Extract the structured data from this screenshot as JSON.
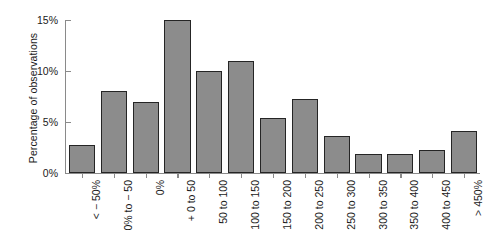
{
  "chart_data": {
    "type": "bar",
    "title": "",
    "subtitle": "",
    "xlabel": "",
    "ylabel": "Percentage of observations",
    "ylim": [
      0,
      15
    ],
    "ytick_labels": [
      "0%",
      "5%",
      "10%",
      "15%"
    ],
    "ytick_values": [
      0,
      5,
      10,
      15
    ],
    "grid": false,
    "legend": null,
    "bar_color": "#8c8c8c",
    "bar_edge_color": "#252525",
    "background_color": "#ffffff",
    "axis_color": "#8a8a8a",
    "categories": [
      "< − 50%",
      "0% to − 50",
      "0%",
      "+ 0 to 50",
      "50 to 100",
      "100 to 150",
      "150 to 200",
      "200 to 250",
      "250 to 300",
      "300 to 350",
      "350 to 400",
      "400 to 450",
      "> 450%"
    ],
    "values": [
      2.7,
      8.0,
      7.0,
      15.0,
      10.0,
      11.0,
      5.4,
      7.3,
      3.6,
      1.9,
      1.9,
      2.3,
      4.1
    ]
  }
}
